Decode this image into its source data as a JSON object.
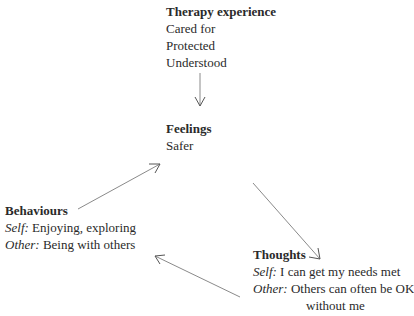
{
  "nodes": {
    "therapy": {
      "title": "Therapy experience",
      "lines": [
        "Cared for",
        "Protected",
        "Understood"
      ]
    },
    "feelings": {
      "title": "Feelings",
      "lines": [
        "Safer"
      ]
    },
    "behaviours": {
      "title": "Behaviours",
      "self_label": "Self:",
      "self_text": "Enjoying, exploring",
      "other_label": "Other:",
      "other_text": "Being with others"
    },
    "thoughts": {
      "title": "Thoughts",
      "self_label": "Self:",
      "self_text": "I can get my needs met",
      "other_label": "Other:",
      "other_text": "Others can often be OK",
      "other_text_cont": "without me"
    }
  },
  "edges": [
    {
      "from": "therapy",
      "to": "feelings"
    },
    {
      "from": "feelings",
      "to": "thoughts"
    },
    {
      "from": "thoughts",
      "to": "behaviours"
    },
    {
      "from": "behaviours",
      "to": "feelings"
    }
  ],
  "colors": {
    "text": "#2a2a2a",
    "arrow": "#8a8a8a"
  }
}
